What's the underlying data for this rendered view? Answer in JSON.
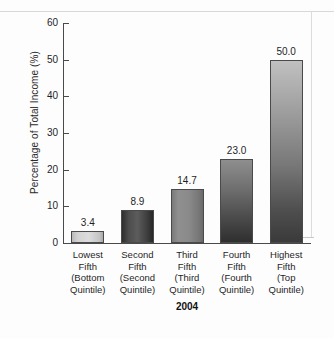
{
  "chart_data": {
    "type": "bar",
    "title": "",
    "subtitle": "",
    "xlabel": "2004",
    "ylabel": "Percentage of Total Income (%)",
    "categories": [
      "Lowest Fifth (Bottom Quintile)",
      "Second Fifth (Second Quintile)",
      "Third Fifth (Third Quintile)",
      "Fourth Fifth (Fourth Quintile)",
      "Highest Fifth (Top Quintile)"
    ],
    "category_lines": [
      [
        "Lowest",
        "Fifth",
        "(Bottom",
        "Quintile)"
      ],
      [
        "Second",
        "Fifth",
        "(Second",
        "Quintile)"
      ],
      [
        "Third",
        "Fifth",
        "(Third",
        "Quintile)"
      ],
      [
        "Fourth",
        "Fifth",
        "(Fourth",
        "Quintile)"
      ],
      [
        "Highest",
        "Fifth",
        "(Top",
        "Quintile)"
      ]
    ],
    "values": [
      3.4,
      8.9,
      14.7,
      23.0,
      50.0
    ],
    "value_labels": [
      "3.4",
      "8.9",
      "14.7",
      "23.0",
      "50.0"
    ],
    "ylim": [
      0,
      60
    ],
    "yticks": [
      0,
      10,
      20,
      30,
      40,
      50,
      60
    ],
    "ytick_labels": [
      "0",
      "10",
      "20",
      "30",
      "40",
      "50",
      "60"
    ],
    "grid": false,
    "legend": "none",
    "bar_colors": [
      "#d2d2d2",
      "#4d4d4d",
      "#888888",
      "#5c5c5c",
      "#8a8a8a"
    ],
    "axis_color": "#4a4a4a",
    "text_color": "#1f1f1f"
  }
}
